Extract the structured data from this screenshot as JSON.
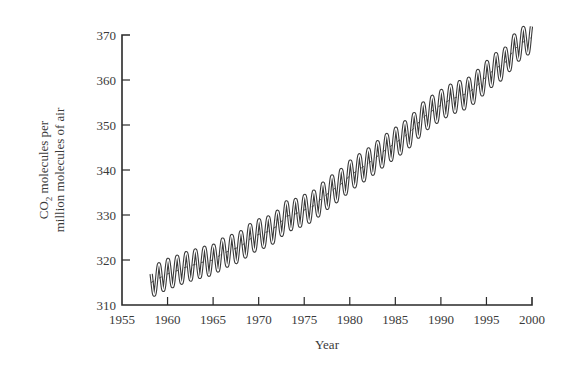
{
  "chart_data": {
    "type": "line",
    "title": "",
    "xlabel": "Year",
    "ylabel_line1": "CO2 molecules per",
    "ylabel_line2": "million molecules of air",
    "xlim": [
      1955,
      2000
    ],
    "ylim": [
      310,
      370
    ],
    "x_ticks": [
      1955,
      1960,
      1965,
      1970,
      1975,
      1980,
      1985,
      1990,
      1995,
      2000
    ],
    "y_ticks": [
      310,
      320,
      330,
      340,
      350,
      360,
      370
    ],
    "grid": false,
    "legend": null,
    "seasonal_amplitude_ppm": 3.2,
    "series": [
      {
        "name": "Atmospheric CO2 (annual mean trend)",
        "x": [
          1958.2,
          1959,
          1960,
          1961,
          1962,
          1963,
          1964,
          1965,
          1966,
          1967,
          1968,
          1969,
          1970,
          1971,
          1972,
          1973,
          1974,
          1975,
          1976,
          1977,
          1978,
          1979,
          1980,
          1981,
          1982,
          1983,
          1984,
          1985,
          1986,
          1987,
          1988,
          1989,
          1990,
          1991,
          1992,
          1993,
          1994,
          1995,
          1996,
          1997,
          1998,
          1999,
          2000
        ],
        "values": [
          315.0,
          315.9,
          316.9,
          317.6,
          318.4,
          319.0,
          319.6,
          320.0,
          321.4,
          322.2,
          323.0,
          324.6,
          325.7,
          326.3,
          327.5,
          329.7,
          330.2,
          331.1,
          332.0,
          333.8,
          335.4,
          336.8,
          338.7,
          340.1,
          341.4,
          343.0,
          344.6,
          346.0,
          347.4,
          349.2,
          351.6,
          353.1,
          354.4,
          355.6,
          356.4,
          357.1,
          358.8,
          360.8,
          362.6,
          363.7,
          366.7,
          368.4,
          369.5
        ]
      }
    ]
  },
  "axes": {
    "x_label": "Year",
    "y_label_prefix": "CO",
    "y_label_subscript": "2",
    "y_label_rest": " molecules per",
    "y_label_line2": "million molecules of air"
  }
}
